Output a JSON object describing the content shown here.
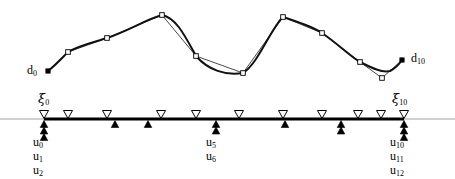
{
  "figure": {
    "colors": {
      "ink": "#000000",
      "curve": "#111111",
      "polygon": "#333333",
      "axis_thin": "#888888",
      "marker_fill": "#ffffff"
    }
  },
  "curve_panel": {
    "name": "control-polygon-and-curve",
    "endpoint_labels": {
      "start": "d",
      "start_sub": "0",
      "end": "d",
      "end_sub": "10"
    },
    "control_points": [
      {
        "index": 0,
        "x": 48,
        "y": 71,
        "filled": true
      },
      {
        "index": 1,
        "x": 68,
        "y": 52,
        "filled": false
      },
      {
        "index": 2,
        "x": 107,
        "y": 38,
        "filled": false
      },
      {
        "index": 3,
        "x": 162,
        "y": 15,
        "filled": false
      },
      {
        "index": 4,
        "x": 196,
        "y": 56,
        "filled": false
      },
      {
        "index": 5,
        "x": 243,
        "y": 73,
        "filled": false
      },
      {
        "index": 6,
        "x": 283,
        "y": 17,
        "filled": false
      },
      {
        "index": 7,
        "x": 322,
        "y": 33,
        "filled": false
      },
      {
        "index": 8,
        "x": 360,
        "y": 62,
        "filled": false
      },
      {
        "index": 9,
        "x": 382,
        "y": 78,
        "filled": false
      },
      {
        "index": 10,
        "x": 402,
        "y": 60,
        "filled": true
      }
    ],
    "curve_path": "M48,71 C56,65 62,58 68,52 C80,45 95,42 107,38 C128,31 147,19 162,15 C176,18 184,34 196,56 C208,70 226,76 243,73 C258,64 271,28 283,17 C298,22 312,26 322,33 C338,44 350,56 360,62 C372,68 382,73 390,71 C396,68 400,63 402,60"
  },
  "knot_panel": {
    "name": "parameter-axis",
    "axis": {
      "y": 119,
      "x_start": 0,
      "x_end": 455,
      "bold_x_start": 44,
      "bold_x_end": 404
    },
    "knot_label_left": {
      "glyph": "ξ",
      "sub": "0",
      "x": 38,
      "y": 92
    },
    "knot_label_right": {
      "glyph": "ξ",
      "sub": "10",
      "x": 392,
      "y": 92
    },
    "knots_down_triangles": [
      {
        "index": 0,
        "x": 44
      },
      {
        "index": 1,
        "x": 68
      },
      {
        "index": 2,
        "x": 107
      },
      {
        "index": 3,
        "x": 161
      },
      {
        "index": 4,
        "x": 196
      },
      {
        "index": 5,
        "x": 239
      },
      {
        "index": 6,
        "x": 283
      },
      {
        "index": 7,
        "x": 322
      },
      {
        "index": 8,
        "x": 358
      },
      {
        "index": 9,
        "x": 381
      },
      {
        "index": 10,
        "x": 404
      }
    ],
    "params_up_triangles": [
      {
        "x": 44,
        "stack": 3
      },
      {
        "x": 115,
        "stack": 1
      },
      {
        "x": 148,
        "stack": 1
      },
      {
        "x": 216,
        "stack": 2
      },
      {
        "x": 285,
        "stack": 1
      },
      {
        "x": 341,
        "stack": 2
      },
      {
        "x": 404,
        "stack": 3
      }
    ],
    "param_label_groups": [
      {
        "name": "u-group-left",
        "x": 33,
        "y": 136,
        "items": [
          {
            "base": "u",
            "sub": "0"
          },
          {
            "base": "u",
            "sub": "1"
          },
          {
            "base": "u",
            "sub": "2"
          }
        ]
      },
      {
        "name": "u-group-middle",
        "x": 206,
        "y": 136,
        "items": [
          {
            "base": "u",
            "sub": "5"
          },
          {
            "base": "u",
            "sub": "6"
          }
        ]
      },
      {
        "name": "u-group-right",
        "x": 390,
        "y": 136,
        "items": [
          {
            "base": "u",
            "sub": "10"
          },
          {
            "base": "u",
            "sub": "11"
          },
          {
            "base": "u",
            "sub": "12"
          }
        ]
      }
    ]
  }
}
